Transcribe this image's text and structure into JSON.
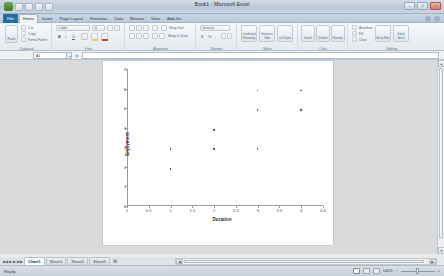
{
  "window": {
    "title": "Book1 - Microsoft Excel",
    "minimize_label": "–",
    "maximize_label": "□",
    "close_label": "×"
  },
  "quick_access": {
    "save_label": "save-icon",
    "undo_label": "undo-icon",
    "redo_label": "redo-icon",
    "customize_label": "customize-icon"
  },
  "ribbon": {
    "tabs": [
      {
        "label": "File"
      },
      {
        "label": "Home"
      },
      {
        "label": "Insert"
      },
      {
        "label": "Page Layout"
      },
      {
        "label": "Formulas"
      },
      {
        "label": "Data"
      },
      {
        "label": "Review"
      },
      {
        "label": "View"
      },
      {
        "label": "Add-Ins"
      }
    ],
    "active_tab": "Home",
    "groups": [
      {
        "label": "Clipboard"
      },
      {
        "label": "Font"
      },
      {
        "label": "Alignment"
      },
      {
        "label": "Number"
      },
      {
        "label": "Styles"
      },
      {
        "label": "Cells"
      },
      {
        "label": "Editing"
      }
    ],
    "clipboard": {
      "paste": "Paste",
      "cut": "Cut",
      "copy": "Copy",
      "format_painter": "Format Painter"
    },
    "font": {
      "font_name": "Calibri",
      "font_size": "11",
      "bold": "B",
      "italic": "I",
      "underline": "U",
      "borders": "Borders",
      "fill_color": "Fill Color",
      "font_color": "Font Color"
    },
    "alignment": {
      "wrap_text": "Wrap Text",
      "merge_center": "Merge & Center"
    },
    "number": {
      "format": "General",
      "percent": "%",
      "comma": ",",
      "increase_decimal": ".00",
      "decrease_decimal": ".0"
    },
    "styles": {
      "conditional_formatting": "Conditional Formatting",
      "format_as_table": "Format as Table",
      "cell_styles": "Cell Styles"
    },
    "cells": {
      "insert": "Insert",
      "delete": "Delete",
      "format": "Format"
    },
    "editing": {
      "autosum": "AutoSum",
      "fill": "Fill",
      "clear": "Clear",
      "sort_filter": "Sort & Filter",
      "find_select": "Find & Select"
    }
  },
  "formula_bar": {
    "name_box_value": "A1",
    "fx_label": "fx",
    "formula_value": ""
  },
  "chart_data": {
    "type": "scatter",
    "title": "",
    "xlabel": "Duration",
    "ylabel": "Enjoyment",
    "xlim": [
      0,
      4.5
    ],
    "ylim": [
      0,
      7
    ],
    "xticks": [
      0,
      0.5,
      1,
      1.5,
      2,
      2.5,
      3,
      3.5,
      4,
      4.5
    ],
    "yticks": [
      0,
      1,
      2,
      3,
      4,
      5,
      6,
      7
    ],
    "grid": false,
    "legend": "none",
    "marker_color": "#4f4f4f",
    "points": [
      {
        "x": 1,
        "y": 3
      },
      {
        "x": 1,
        "y": 2
      },
      {
        "x": 2,
        "y": 4
      },
      {
        "x": 2,
        "y": 3
      },
      {
        "x": 3,
        "y": 6
      },
      {
        "x": 3,
        "y": 5
      },
      {
        "x": 3,
        "y": 3
      },
      {
        "x": 4,
        "y": 6
      },
      {
        "x": 4,
        "y": 5
      }
    ]
  },
  "sheet_tabs": {
    "nav_first": "◀◀",
    "nav_prev": "◀",
    "nav_next": "▶",
    "nav_last": "▶▶",
    "tabs": [
      {
        "label": "Chart1",
        "active": true
      },
      {
        "label": "Sheet1",
        "active": false
      },
      {
        "label": "Sheet2",
        "active": false
      },
      {
        "label": "Sheet3",
        "active": false
      }
    ],
    "new_sheet_label": "➕"
  },
  "status_bar": {
    "status_text": "Ready",
    "zoom_level": "100%",
    "view_normal": "Normal",
    "view_page_layout": "Page Layout",
    "view_page_break": "Page Break Preview",
    "zoom_out": "−",
    "zoom_in": "+"
  },
  "scrollbars": {
    "v_up": "▲",
    "v_down": "▼",
    "h_left": "◀",
    "h_right": "▶"
  }
}
